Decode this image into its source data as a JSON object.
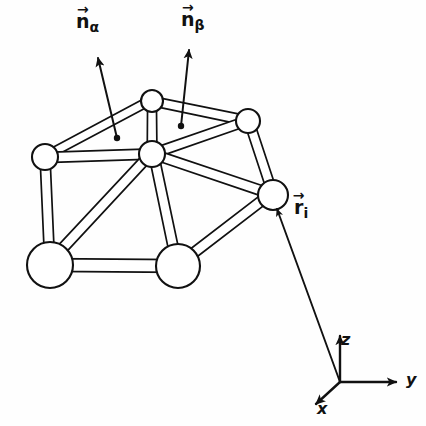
{
  "figure": {
    "background_color": "#fefefe",
    "ink_color": "#111111"
  },
  "labels": {
    "normal_alpha": {
      "symbol": "n",
      "subscript": "α",
      "arrow": "→",
      "full": "n⃗α"
    },
    "normal_beta": {
      "symbol": "n",
      "subscript": "β",
      "arrow": "→",
      "full": "n⃗β"
    },
    "position_i": {
      "symbol": "r",
      "subscript": "i",
      "arrow": "→",
      "full": "r⃗i"
    }
  },
  "axes": {
    "origin_label": "",
    "z": "z",
    "y": "y",
    "x": "x"
  },
  "atoms": [
    {
      "id": "top",
      "cx": 152,
      "cy": 101,
      "r": 11
    },
    {
      "id": "center-hub",
      "cx": 152,
      "cy": 154,
      "r": 13
    },
    {
      "id": "left",
      "cx": 45,
      "cy": 157,
      "r": 13
    },
    {
      "id": "upper-right",
      "cx": 248,
      "cy": 121,
      "r": 12
    },
    {
      "id": "far-right",
      "cx": 273,
      "cy": 195,
      "r": 15
    },
    {
      "id": "front-left",
      "cx": 50,
      "cy": 265,
      "r": 23
    },
    {
      "id": "front-right",
      "cx": 178,
      "cy": 266,
      "r": 22
    }
  ],
  "bonds": [
    {
      "from": "left",
      "to": "top",
      "width": 4.0
    },
    {
      "from": "left",
      "to": "center-hub",
      "width": 4.0
    },
    {
      "from": "top",
      "to": "center-hub",
      "width": 4.0
    },
    {
      "from": "top",
      "to": "upper-right",
      "width": 4.0
    },
    {
      "from": "center-hub",
      "to": "upper-right",
      "width": 4.0
    },
    {
      "from": "upper-right",
      "to": "far-right",
      "width": 4.0
    },
    {
      "from": "center-hub",
      "to": "far-right",
      "width": 4.0
    },
    {
      "from": "left",
      "to": "front-left",
      "width": 4.0
    },
    {
      "from": "center-hub",
      "to": "front-left",
      "width": 4.0
    },
    {
      "from": "center-hub",
      "to": "front-right",
      "width": 4.0
    },
    {
      "from": "front-left",
      "to": "front-right",
      "width": 4.5
    },
    {
      "from": "front-right",
      "to": "far-right",
      "width": 4.5
    }
  ],
  "vectors": {
    "n_alpha": {
      "tail_x": 117,
      "tail_y": 138,
      "head_x": 97,
      "head_y": 56
    },
    "n_beta": {
      "tail_x": 181,
      "tail_y": 126,
      "head_x": 189,
      "head_y": 48
    },
    "r_i": {
      "tail_x": 340,
      "tail_y": 382,
      "head_x": 277,
      "head_y": 208
    }
  },
  "axis_geometry": {
    "origin_x": 340,
    "origin_y": 382,
    "z_x": 340,
    "z_y": 334,
    "y_x": 398,
    "y_y": 382,
    "x_x": 314,
    "x_y": 406
  }
}
